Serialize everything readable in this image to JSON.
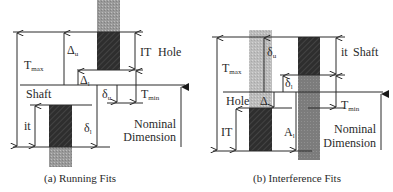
{
  "figure": {
    "panel_a": {
      "caption": "(a) Running Fits",
      "labels": {
        "t_max": "T",
        "t_max_sub": "max",
        "delta_u": "Δ",
        "delta_u_sub": "u",
        "delta_l": "Δ",
        "delta_l_sub": "l",
        "it_hole": "IT",
        "hole": "Hole",
        "shaft": "Shaft",
        "small_delta_u": "δ",
        "small_delta_u_sub": "u",
        "t_min": "T",
        "t_min_sub": "min",
        "it_shaft": "it",
        "small_delta_l": "δ",
        "small_delta_l_sub": "l",
        "nominal_line1": "Nominal",
        "nominal_line2": "Dimension"
      }
    },
    "panel_b": {
      "caption": "(b) Interference Fits",
      "labels": {
        "t_max": "T",
        "t_max_sub": "max",
        "small_delta_u": "δ",
        "small_delta_u_sub": "u",
        "it_shaft": "it",
        "shaft": "Shaft",
        "small_delta_l": "δ",
        "small_delta_l_sub": "l",
        "hole": "Hole",
        "delta": "Δ",
        "t_min": "T",
        "t_min_sub": "min",
        "it_hole": "IT",
        "a_l": "A",
        "a_l_sub": "l",
        "nominal_line1": "Nominal",
        "nominal_line2": "Dimension"
      }
    },
    "colors": {
      "dark_zone": "#2e2e2e",
      "mid_gray": "#7a7a7a",
      "light_gray": "#b5b5b5",
      "line": "#2a2a2a"
    }
  }
}
